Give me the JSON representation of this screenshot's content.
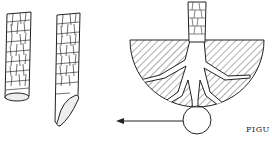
{
  "figure": {
    "caption": "FIGU",
    "panels": [
      {
        "name": "straight-cut-root-segment",
        "description": "root piece with straight cut end"
      },
      {
        "name": "slanted-cut-root-segment",
        "description": "root piece with slanted cut end"
      },
      {
        "name": "root-system-cross-section",
        "description": "tree trunk with roots in hatched semicircular soil section, circle highlight at bottom with arrow pointing left"
      }
    ],
    "colors": {
      "ink": "#222222",
      "background": "#ffffff"
    }
  }
}
